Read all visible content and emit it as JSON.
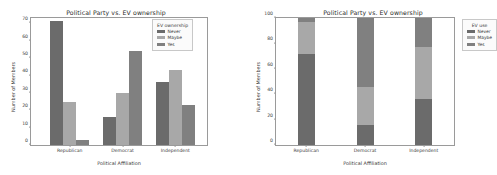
{
  "figure": {
    "background": "#ffffff",
    "palette": {
      "never": "#6b6b6b",
      "maybe": "#a8a8a8",
      "yes": "#808080",
      "axis": "#9a9a9a",
      "text": "#3a3a3a"
    }
  },
  "panels": [
    {
      "id": "grouped",
      "title": "Political Party vs. EV ownership",
      "xlabel": "Political Affiliation",
      "ylabel": "Number of Members",
      "legend_title": "EV ownership",
      "yticks": [
        "0",
        "10",
        "20",
        "30",
        "40",
        "50",
        "60",
        "70"
      ],
      "xticks": [
        "Republican",
        "Democrat",
        "Independent"
      ],
      "legend": [
        "Never",
        "Maybe",
        "Yes"
      ]
    },
    {
      "id": "stacked",
      "title": "Political Party vs. EV ownership",
      "xlabel": "Political Affiliation",
      "ylabel": "Number of Members",
      "legend_title": "EV use",
      "yticks": [
        "0",
        "20",
        "40",
        "60",
        "80",
        "100"
      ],
      "xticks": [
        "Republican",
        "Democrat",
        "Independent"
      ],
      "legend": [
        "Never",
        "Maybe",
        "Yes"
      ]
    }
  ],
  "chart_data": [
    {
      "type": "bar",
      "title": "Political Party vs. EV ownership",
      "xlabel": "Political Affiliation",
      "ylabel": "Number of Members",
      "categories": [
        "Republican",
        "Democrat",
        "Independent"
      ],
      "series": [
        {
          "name": "Never",
          "values": [
            71,
            16,
            36
          ],
          "color": "#6b6b6b"
        },
        {
          "name": "Maybe",
          "values": [
            25,
            30,
            43
          ],
          "color": "#a8a8a8"
        },
        {
          "name": "Yes",
          "values": [
            3,
            54,
            23
          ],
          "color": "#808080"
        }
      ],
      "ylim": [
        0,
        73
      ],
      "yticks": [
        0,
        10,
        20,
        30,
        40,
        50,
        60,
        70
      ],
      "grid": false,
      "legend_title": "EV ownership",
      "legend_position": "upper right"
    },
    {
      "type": "bar",
      "subtype": "stacked-100",
      "title": "Political Party vs. EV ownership",
      "xlabel": "Political Affiliation",
      "ylabel": "Number of Members",
      "categories": [
        "Republican",
        "Democrat",
        "Independent"
      ],
      "series": [
        {
          "name": "Never",
          "values": [
            72,
            16,
            36
          ],
          "color": "#6b6b6b"
        },
        {
          "name": "Maybe",
          "values": [
            25,
            30,
            41
          ],
          "color": "#a8a8a8"
        },
        {
          "name": "Yes",
          "values": [
            3,
            54,
            23
          ],
          "color": "#808080"
        }
      ],
      "ylim": [
        0,
        100
      ],
      "yticks": [
        0,
        20,
        40,
        60,
        80,
        100
      ],
      "grid": false,
      "legend_title": "EV use",
      "legend_position": "outside right"
    }
  ]
}
